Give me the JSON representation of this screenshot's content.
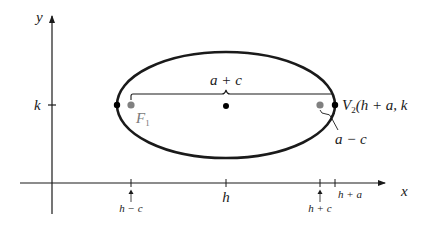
{
  "diagram": {
    "axes": {
      "x_label": "x",
      "y_label": "y",
      "y_tick_label": "k"
    },
    "x_ticks": [
      {
        "label": "h − c",
        "position": "h-c"
      },
      {
        "label": "h",
        "position": "h"
      },
      {
        "label": "h + c",
        "position": "h+c"
      },
      {
        "label": "h + a",
        "position": "h+a"
      }
    ],
    "points": {
      "focus_left": {
        "label": "F",
        "subscript": "1",
        "color": "#808080"
      },
      "focus_right": {
        "color": "#808080"
      },
      "center": {
        "color": "#000000"
      },
      "vertex_left": {
        "color": "#000000"
      },
      "vertex_right": {
        "label_prefix": "V",
        "subscript": "2",
        "label_suffix": "(h + a, k",
        "color": "#000000"
      }
    },
    "annotations": {
      "brace_label": "a + c",
      "small_brace_label": "a − c"
    },
    "colors": {
      "ink": "#1a1a1a",
      "focus_gray": "#808080",
      "background": "#ffffff"
    }
  }
}
